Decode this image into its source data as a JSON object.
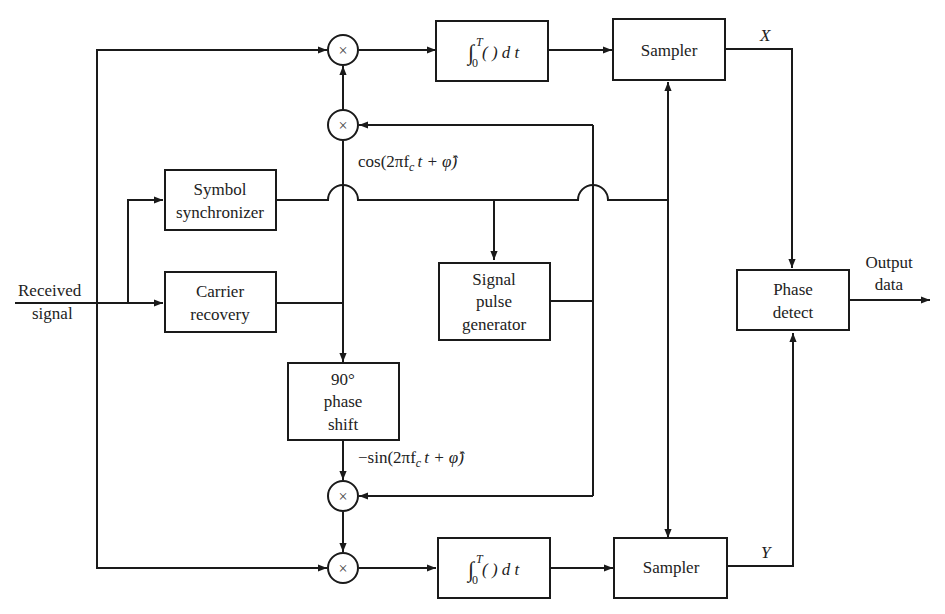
{
  "diagram": {
    "title": "",
    "input_label": [
      "Received",
      "signal"
    ],
    "output_label": [
      "Output",
      "data"
    ],
    "blocks": {
      "symbol_sync": [
        "Symbol",
        "synchronizer"
      ],
      "carrier_recovery": [
        "Carrier",
        "recovery"
      ],
      "pulse_gen": [
        "Signal",
        "pulse",
        "generator"
      ],
      "phase_shift": [
        "90°",
        "phase",
        "shift"
      ],
      "integrator_top": "∫₀ᵀ( ) d t",
      "integrator_bottom": "∫₀ᵀ( ) d t",
      "sampler_top": "Sampler",
      "sampler_bottom": "Sampler",
      "phase_detect": [
        "Phase",
        "detect"
      ]
    },
    "multiplier_symbol": "×",
    "signals": {
      "cos_ref": "cos(2πf",
      "cos_sub": "c",
      "cos_tail": "t + φ̂)",
      "sin_ref": "−sin(2πf",
      "sin_sub": "c",
      "sin_tail": "t + φ̂)",
      "x_out": "X",
      "y_out": "Y"
    },
    "integral": {
      "sign": "∫",
      "upper": "T",
      "lower": "0",
      "body": "( ) d t"
    }
  }
}
